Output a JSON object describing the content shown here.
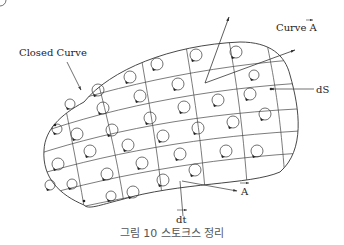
{
  "figure": {
    "labels": {
      "closed_curve": "Closed Curve",
      "curve_a": "Curve A",
      "ds": "dS",
      "a_vector": "A",
      "dt": "dt"
    },
    "caption": "그림 10 스토크스 정리"
  },
  "colors": {
    "line": "#333333",
    "text": "#222222",
    "caption": "#555555"
  }
}
